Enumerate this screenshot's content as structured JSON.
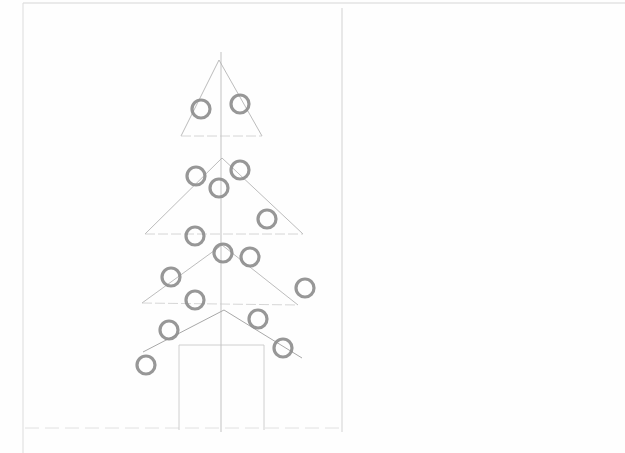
{
  "drawing": {
    "subject": "Christmas tree pencil sketch",
    "colors": {
      "paper": "#fefefe",
      "guide_line": "#c8c8c8",
      "construction_line": "#b4b4b4",
      "ornament": "#8c8c8c"
    },
    "frame": {
      "left": 23,
      "top": 3,
      "right": 625,
      "bottom": 453
    },
    "divider_x": 342,
    "center_axis": {
      "x": 221,
      "y1": 52,
      "y2": 432
    },
    "baseline": {
      "y": 428,
      "x1": 25,
      "x2": 342
    },
    "tiers": [
      {
        "apex": [
          219,
          60
        ],
        "left": [
          181,
          136
        ],
        "right": [
          262,
          136
        ]
      },
      {
        "apex": [
          222,
          158
        ],
        "left": [
          145,
          234
        ],
        "right": [
          303,
          234
        ]
      },
      {
        "apex": [
          222,
          245
        ],
        "left": [
          142,
          303
        ],
        "right": [
          298,
          305
        ]
      }
    ],
    "bottom_branch": {
      "points": [
        [
          143,
          352
        ],
        [
          224,
          310
        ],
        [
          302,
          358
        ]
      ]
    },
    "trunk": {
      "x1": 179,
      "y1": 345,
      "x2": 264,
      "y2": 430
    },
    "ornaments": [
      {
        "cx": 201,
        "cy": 109
      },
      {
        "cx": 240,
        "cy": 104
      },
      {
        "cx": 196,
        "cy": 176
      },
      {
        "cx": 240,
        "cy": 170
      },
      {
        "cx": 219,
        "cy": 188
      },
      {
        "cx": 267,
        "cy": 219
      },
      {
        "cx": 195,
        "cy": 236
      },
      {
        "cx": 223,
        "cy": 253
      },
      {
        "cx": 250,
        "cy": 257
      },
      {
        "cx": 171,
        "cy": 277
      },
      {
        "cx": 305,
        "cy": 288
      },
      {
        "cx": 195,
        "cy": 300
      },
      {
        "cx": 169,
        "cy": 330
      },
      {
        "cx": 258,
        "cy": 319
      },
      {
        "cx": 283,
        "cy": 348
      },
      {
        "cx": 146,
        "cy": 365
      }
    ]
  }
}
